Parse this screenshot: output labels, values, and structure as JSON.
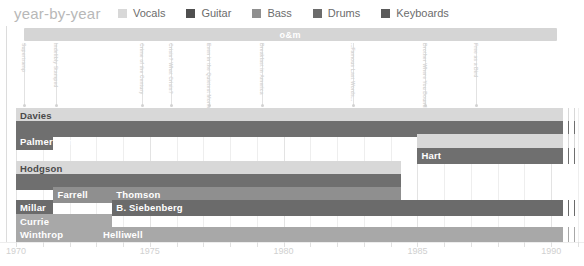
{
  "header": {
    "title": "year-by-year",
    "legend": [
      {
        "label": "Vocals",
        "color": "#d8d8d8"
      },
      {
        "label": "Guitar",
        "color": "#4f4f4f"
      },
      {
        "label": "Bass",
        "color": "#8f8f8f"
      },
      {
        "label": "Drums",
        "color": "#6b6b6b"
      },
      {
        "label": "Keyboards",
        "color": "#5a5a5a"
      }
    ]
  },
  "chart_data": {
    "type": "bar",
    "title": "year-by-year",
    "xlabel": "",
    "ylabel": "",
    "xlim": [
      1970,
      1991
    ],
    "grid": true,
    "legend_position": "top",
    "axis": {
      "ticks": [
        1970,
        1971,
        1972,
        1973,
        1974,
        1975,
        1976,
        1977,
        1978,
        1979,
        1980,
        1981,
        1982,
        1983,
        1984,
        1985,
        1986,
        1987,
        1988,
        1989,
        1990,
        1991
      ],
      "labeled_ticks": [
        {
          "value": 1970,
          "label": "1970"
        },
        {
          "value": 1975,
          "label": "1975"
        },
        {
          "value": 1980,
          "label": "1980"
        },
        {
          "value": 1985,
          "label": "1985"
        },
        {
          "value": 1990,
          "label": "1990"
        }
      ]
    },
    "eras": [
      {
        "label": "o&m",
        "start": 1970.3,
        "end": 1990.2,
        "color": "#d5d5d5"
      }
    ],
    "albums": [
      {
        "label": "Supertramp",
        "year": 1970.3
      },
      {
        "label": "Indelibly Stamped",
        "year": 1971.5
      },
      {
        "label": "Crime of the Century",
        "year": 1974.7
      },
      {
        "label": "Crisis? What Crisis?",
        "year": 1975.8
      },
      {
        "label": "Even in the Quietest Moments...",
        "year": 1977.2
      },
      {
        "label": "Breakfast in America",
        "year": 1979.2
      },
      {
        "label": "...Famous Last Words...",
        "year": 1982.6
      },
      {
        "label": "Brother Where You Bound",
        "year": 1985.3
      },
      {
        "label": "Free as a Bird",
        "year": 1987.2
      }
    ],
    "series": [
      {
        "name": "Davies",
        "role": "Vocals",
        "row": 0,
        "segments": [
          {
            "label": "Davies",
            "start": 1970.0,
            "end": 1990.4,
            "color": "#d8d8d8",
            "label_color": "dark",
            "dashed": false
          },
          {
            "label": "",
            "start": 1990.4,
            "end": 1991.0,
            "color": "#d8d8d8",
            "label_color": "dark",
            "dashed": true
          }
        ]
      },
      {
        "name": "Davies-guitar",
        "role": "Guitar",
        "row": 1,
        "segments": [
          {
            "label": "",
            "start": 1970.0,
            "end": 1990.4,
            "color": "#6f6f6f",
            "label_color": "light",
            "dashed": false
          },
          {
            "label": "",
            "start": 1990.4,
            "end": 1991.0,
            "color": "#6f6f6f",
            "label_color": "light",
            "dashed": true
          }
        ]
      },
      {
        "name": "Palmer-James",
        "role": "Guitar",
        "row": 2,
        "segments": [
          {
            "label": "Palmer-James",
            "start": 1970.0,
            "end": 1971.4,
            "color": "#6f6f6f",
            "label_color": "light",
            "dashed": false
          }
        ]
      },
      {
        "name": "Hart-vocals",
        "role": "Vocals",
        "row": 2,
        "segments": [
          {
            "label": "",
            "start": 1985.0,
            "end": 1990.4,
            "color": "#d8d8d8",
            "label_color": "dark",
            "dashed": false
          },
          {
            "label": "",
            "start": 1990.4,
            "end": 1991.0,
            "color": "#d8d8d8",
            "label_color": "dark",
            "dashed": true
          }
        ]
      },
      {
        "name": "Hart",
        "role": "Guitar",
        "row": 3,
        "segments": [
          {
            "label": "Hart",
            "start": 1985.0,
            "end": 1990.4,
            "color": "#6f6f6f",
            "label_color": "light",
            "dashed": false
          },
          {
            "label": "",
            "start": 1990.4,
            "end": 1991.0,
            "color": "#6f6f6f",
            "label_color": "light",
            "dashed": true
          }
        ]
      },
      {
        "name": "Hodgson",
        "role": "Vocals",
        "row": 4,
        "segments": [
          {
            "label": "Hodgson",
            "start": 1970.0,
            "end": 1984.4,
            "color": "#d8d8d8",
            "label_color": "dark",
            "dashed": false
          }
        ]
      },
      {
        "name": "Hodgson-guitar",
        "role": "Guitar",
        "row": 5,
        "segments": [
          {
            "label": "",
            "start": 1970.0,
            "end": 1984.4,
            "color": "#6f6f6f",
            "label_color": "light",
            "dashed": false
          }
        ]
      },
      {
        "name": "Farrell-Thomson",
        "role": "Bass",
        "row": 6,
        "segments": [
          {
            "label": "Farrell",
            "start": 1971.4,
            "end": 1973.6,
            "color": "#8f8f8f",
            "label_color": "light",
            "dashed": false
          },
          {
            "label": "Thomson",
            "start": 1973.6,
            "end": 1984.4,
            "color": "#8f8f8f",
            "label_color": "light",
            "dashed": false
          }
        ]
      },
      {
        "name": "Millar-Siebenberg",
        "role": "Drums",
        "row": 7,
        "segments": [
          {
            "label": "Millar",
            "start": 1970.0,
            "end": 1971.4,
            "color": "#6b6b6b",
            "label_color": "light",
            "dashed": false
          },
          {
            "label": "B. Siebenberg",
            "start": 1973.6,
            "end": 1990.4,
            "color": "#6b6b6b",
            "label_color": "light",
            "dashed": false
          },
          {
            "label": "",
            "start": 1990.4,
            "end": 1991.0,
            "color": "#6b6b6b",
            "label_color": "light",
            "dashed": true
          }
        ]
      },
      {
        "name": "Currie",
        "role": "Keyboards",
        "row": 8,
        "segments": [
          {
            "label": "Currie",
            "start": 1970.0,
            "end": 1973.6,
            "color": "#a8a8a8",
            "label_color": "light",
            "dashed": false
          }
        ]
      },
      {
        "name": "Winthrop-Helliwell",
        "role": "Keyboards",
        "row": 9,
        "segments": [
          {
            "label": "Winthrop",
            "start": 1970.0,
            "end": 1973.1,
            "color": "#a8a8a8",
            "label_color": "light",
            "dashed": false
          },
          {
            "label": "Helliwell",
            "start": 1973.1,
            "end": 1990.4,
            "color": "#a8a8a8",
            "label_color": "light",
            "dashed": false
          },
          {
            "label": "",
            "start": 1990.4,
            "end": 1991.0,
            "color": "#a8a8a8",
            "label_color": "light",
            "dashed": true
          }
        ]
      }
    ]
  }
}
